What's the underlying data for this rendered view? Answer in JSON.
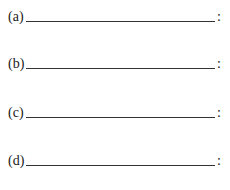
{
  "items": [
    {
      "label": "(a)",
      "value": "",
      "terminator": ":"
    },
    {
      "label": "(b)",
      "value": "",
      "terminator": ":"
    },
    {
      "label": "(c)",
      "value": "",
      "terminator": ":"
    },
    {
      "label": "(d)",
      "value": "",
      "terminator": ":"
    }
  ]
}
